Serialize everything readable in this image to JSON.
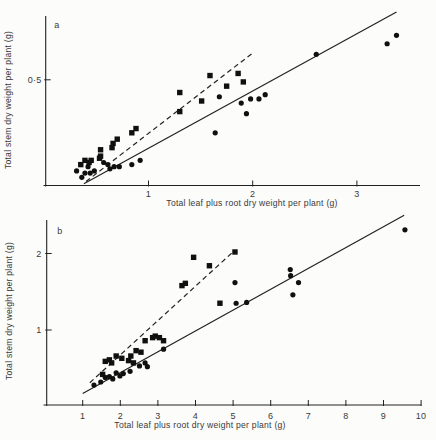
{
  "figure": {
    "background": "#fcfcfa",
    "ink": "#222222",
    "marker_color": "#101010",
    "text_color": "#3a3a3a"
  },
  "chart_data": [
    {
      "type": "scatter",
      "panel_label": "a",
      "xlabel": "Total leaf plus root dry weight per plant (g)",
      "ylabel": "Total stem dry weight per plant (g)",
      "xlim": [
        0,
        3.6
      ],
      "ylim": [
        0,
        0.8
      ],
      "grid": false,
      "legend": null,
      "x_ticks": {
        "values": [
          1,
          2,
          3
        ],
        "labels": [
          "1",
          "2",
          "3"
        ]
      },
      "y_ticks": {
        "values": [
          0.5
        ],
        "labels": [
          "0·5"
        ]
      },
      "series": [
        {
          "name": "circle-series",
          "marker": "circle",
          "points": [
            [
              0.31,
              0.07
            ],
            [
              0.36,
              0.04
            ],
            [
              0.39,
              0.06
            ],
            [
              0.42,
              0.09
            ],
            [
              0.44,
              0.06
            ],
            [
              0.48,
              0.07
            ],
            [
              0.57,
              0.11
            ],
            [
              0.61,
              0.1
            ],
            [
              0.63,
              0.08
            ],
            [
              0.67,
              0.09
            ],
            [
              0.72,
              0.09
            ],
            [
              0.84,
              0.1
            ],
            [
              0.92,
              0.12
            ],
            [
              1.64,
              0.25
            ],
            [
              1.68,
              0.42
            ],
            [
              1.89,
              0.39
            ],
            [
              1.94,
              0.34
            ],
            [
              1.98,
              0.41
            ],
            [
              2.06,
              0.41
            ],
            [
              2.12,
              0.43
            ],
            [
              2.61,
              0.62
            ],
            [
              3.29,
              0.67
            ],
            [
              3.38,
              0.71
            ]
          ]
        },
        {
          "name": "square-series",
          "marker": "square",
          "points": [
            [
              0.35,
              0.1
            ],
            [
              0.39,
              0.12
            ],
            [
              0.43,
              0.11
            ],
            [
              0.45,
              0.12
            ],
            [
              0.53,
              0.13
            ],
            [
              0.54,
              0.14
            ],
            [
              0.54,
              0.17
            ],
            [
              0.65,
              0.18
            ],
            [
              0.66,
              0.2
            ],
            [
              0.7,
              0.22
            ],
            [
              0.84,
              0.25
            ],
            [
              0.88,
              0.27
            ],
            [
              1.3,
              0.35
            ],
            [
              1.3,
              0.44
            ],
            [
              1.51,
              0.4
            ],
            [
              1.59,
              0.52
            ],
            [
              1.75,
              0.47
            ],
            [
              1.86,
              0.53
            ],
            [
              1.91,
              0.49
            ]
          ]
        }
      ],
      "fit_lines": [
        {
          "series": "circle-series",
          "style": "solid",
          "from": [
            0.38,
            0.01
          ],
          "to": [
            3.38,
            0.82
          ]
        },
        {
          "series": "square-series",
          "style": "dashed",
          "from": [
            0.4,
            0.02
          ],
          "to": [
            2.01,
            0.63
          ]
        }
      ]
    },
    {
      "type": "scatter",
      "panel_label": "b",
      "xlabel": "Total leaf plus root dry weight per plant (g)",
      "ylabel": "Total stem dry weight per plant (g)",
      "xlim": [
        0,
        10.1
      ],
      "ylim": [
        0,
        2.45
      ],
      "grid": false,
      "legend": null,
      "x_ticks": {
        "values": [
          1,
          2,
          3,
          4,
          5,
          6,
          7,
          8,
          9,
          10
        ],
        "labels": [
          "1",
          "2",
          "3",
          "4",
          "5",
          "6",
          "7",
          "8",
          "9",
          "10"
        ]
      },
      "y_ticks": {
        "values": [
          1,
          2
        ],
        "labels": [
          "1",
          "2"
        ]
      },
      "series": [
        {
          "name": "circle-series",
          "marker": "circle",
          "points": [
            [
              1.3,
              0.28
            ],
            [
              1.48,
              0.32
            ],
            [
              1.6,
              0.38
            ],
            [
              1.71,
              0.39
            ],
            [
              1.8,
              0.36
            ],
            [
              1.89,
              0.44
            ],
            [
              1.99,
              0.4
            ],
            [
              2.08,
              0.43
            ],
            [
              2.26,
              0.46
            ],
            [
              2.51,
              0.53
            ],
            [
              2.66,
              0.57
            ],
            [
              2.72,
              0.52
            ],
            [
              3.15,
              0.75
            ],
            [
              5.05,
              1.62
            ],
            [
              5.08,
              1.35
            ],
            [
              5.36,
              1.36
            ],
            [
              6.52,
              1.79
            ],
            [
              6.53,
              1.71
            ],
            [
              6.59,
              1.46
            ],
            [
              6.74,
              1.62
            ],
            [
              9.57,
              2.31
            ]
          ]
        },
        {
          "name": "square-series",
          "marker": "square",
          "points": [
            [
              1.53,
              0.42
            ],
            [
              1.6,
              0.59
            ],
            [
              1.71,
              0.61
            ],
            [
              1.77,
              0.57
            ],
            [
              1.89,
              0.66
            ],
            [
              2.04,
              0.63
            ],
            [
              2.22,
              0.6
            ],
            [
              2.28,
              0.66
            ],
            [
              2.35,
              0.57
            ],
            [
              2.42,
              0.73
            ],
            [
              2.55,
              0.71
            ],
            [
              2.66,
              0.86
            ],
            [
              2.86,
              0.9
            ],
            [
              2.93,
              0.92
            ],
            [
              3.04,
              0.9
            ],
            [
              3.15,
              0.86
            ],
            [
              3.64,
              1.58
            ],
            [
              3.73,
              1.61
            ],
            [
              3.95,
              1.95
            ],
            [
              4.37,
              1.84
            ],
            [
              4.65,
              1.35
            ],
            [
              5.05,
              2.02
            ]
          ]
        }
      ],
      "fit_lines": [
        {
          "series": "circle-series",
          "style": "solid",
          "from": [
            1.0,
            0.17
          ],
          "to": [
            9.55,
            2.5
          ]
        },
        {
          "series": "square-series",
          "style": "dashed",
          "from": [
            1.19,
            0.31
          ],
          "to": [
            5.04,
            2.04
          ]
        }
      ]
    }
  ]
}
